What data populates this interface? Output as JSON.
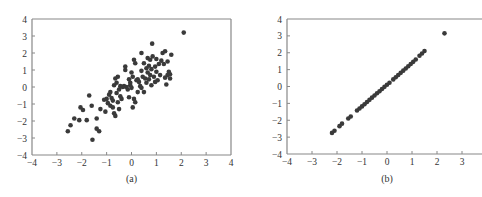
{
  "chart_data": [
    {
      "type": "scatter",
      "title": "",
      "caption": "(a)",
      "xlabel": "",
      "ylabel": "",
      "xlim": [
        -4,
        4
      ],
      "ylim": [
        -4,
        4
      ],
      "xticks": [
        -4,
        -3,
        -2,
        -1,
        0,
        1,
        2,
        3,
        4
      ],
      "yticks": [
        -4,
        -3,
        -2,
        -1,
        0,
        1,
        2,
        3,
        4
      ],
      "grid": false,
      "marker_color": "#3a3a3a",
      "points": [
        [
          2.1,
          3.2
        ],
        [
          0.83,
          2.55
        ],
        [
          -2.56,
          -2.6
        ],
        [
          -1.57,
          -3.1
        ],
        [
          -1.7,
          -0.5
        ],
        [
          -2.45,
          -2.25
        ],
        [
          -2.3,
          -1.85
        ],
        [
          -2.1,
          -1.95
        ],
        [
          -2.05,
          -1.2
        ],
        [
          -1.95,
          -1.35
        ],
        [
          -1.8,
          -1.95
        ],
        [
          -1.6,
          -1.1
        ],
        [
          -1.4,
          -1.85
        ],
        [
          -1.4,
          -2.45
        ],
        [
          -1.3,
          -2.6
        ],
        [
          -1.25,
          -1.3
        ],
        [
          -1.05,
          -1.45
        ],
        [
          -1.0,
          -0.7
        ],
        [
          -0.95,
          -0.95
        ],
        [
          -0.9,
          -0.45
        ],
        [
          -0.85,
          -1.1
        ],
        [
          -0.8,
          -0.65
        ],
        [
          -0.75,
          -0.8
        ],
        [
          -0.75,
          -1.2
        ],
        [
          -0.7,
          0.1
        ],
        [
          -0.7,
          -1.55
        ],
        [
          -0.65,
          0.5
        ],
        [
          -0.65,
          -1.7
        ],
        [
          -0.6,
          -0.35
        ],
        [
          -0.6,
          0.25
        ],
        [
          -0.55,
          -0.9
        ],
        [
          -0.55,
          0.6
        ],
        [
          -0.5,
          -0.15
        ],
        [
          -0.5,
          -1.3
        ],
        [
          -0.45,
          -0.55
        ],
        [
          -0.4,
          -0.7
        ],
        [
          -0.35,
          0.0
        ],
        [
          -0.3,
          0.05
        ],
        [
          -0.25,
          1.0
        ],
        [
          -0.25,
          1.2
        ],
        [
          -0.2,
          0.0
        ],
        [
          -0.15,
          -0.15
        ],
        [
          -0.1,
          0.45
        ],
        [
          -0.1,
          -0.6
        ],
        [
          -0.05,
          0.1
        ],
        [
          0.0,
          0.85
        ],
        [
          0.0,
          -0.05
        ],
        [
          0.05,
          0.6
        ],
        [
          0.05,
          -1.2
        ],
        [
          0.1,
          -0.7
        ],
        [
          0.1,
          1.6
        ],
        [
          0.15,
          1.4
        ],
        [
          0.15,
          -0.9
        ],
        [
          0.2,
          0.4
        ],
        [
          0.25,
          -0.3
        ],
        [
          0.3,
          0.3
        ],
        [
          0.35,
          0.05
        ],
        [
          0.4,
          2.0
        ],
        [
          0.4,
          0.95
        ],
        [
          0.45,
          0.6
        ],
        [
          0.5,
          -0.3
        ],
        [
          0.5,
          1.4
        ],
        [
          0.55,
          0.5
        ],
        [
          0.6,
          1.1
        ],
        [
          0.6,
          0.25
        ],
        [
          0.65,
          0.85
        ],
        [
          0.65,
          1.7
        ],
        [
          0.7,
          0.45
        ],
        [
          0.7,
          1.25
        ],
        [
          0.75,
          1.6
        ],
        [
          0.75,
          0.7
        ],
        [
          0.8,
          1.05
        ],
        [
          0.8,
          0.1
        ],
        [
          0.85,
          1.8
        ],
        [
          0.9,
          0.6
        ],
        [
          0.95,
          1.2
        ],
        [
          0.95,
          0.3
        ],
        [
          1.0,
          0.9
        ],
        [
          1.0,
          1.65
        ],
        [
          1.05,
          0.4
        ],
        [
          1.1,
          1.35
        ],
        [
          1.15,
          0.7
        ],
        [
          1.2,
          1.55
        ],
        [
          1.25,
          2.0
        ],
        [
          1.3,
          1.35
        ],
        [
          1.35,
          0.55
        ],
        [
          1.35,
          2.1
        ],
        [
          1.4,
          0.15
        ],
        [
          1.45,
          1.5
        ],
        [
          1.45,
          0.7
        ],
        [
          1.5,
          0.9
        ],
        [
          1.55,
          0.5
        ],
        [
          1.55,
          0.75
        ],
        [
          1.6,
          1.9
        ],
        [
          -0.85,
          -0.3
        ],
        [
          -1.1,
          -0.75
        ],
        [
          0.25,
          0.45
        ],
        [
          0.4,
          -0.05
        ],
        [
          -0.05,
          0.25
        ],
        [
          -0.45,
          0.05
        ]
      ]
    },
    {
      "type": "scatter",
      "title": "",
      "caption": "(b)",
      "xlabel": "",
      "ylabel": "",
      "xlim": [
        -4,
        4
      ],
      "ylim": [
        -4,
        4
      ],
      "xticks": [
        -4,
        -3,
        -2,
        -1,
        0,
        1,
        2,
        3
      ],
      "yticks": [
        -4,
        -3,
        -2,
        -1,
        0,
        1,
        2,
        3,
        4
      ],
      "grid": false,
      "marker_color": "#3a3a3a",
      "points_description": "points lie on a straight line y ≈ 1.3x from about (-2.25,-2.8) to (1.5,2.15), plus one outlier",
      "line_segment": {
        "x_start": -2.25,
        "y_start": -2.8,
        "x_end": 1.55,
        "y_end": 2.15
      },
      "outlier": [
        2.3,
        3.15
      ],
      "points": [
        [
          -2.2,
          -2.75
        ],
        [
          -2.1,
          -2.62
        ],
        [
          -1.9,
          -2.35
        ],
        [
          -1.8,
          -2.2
        ],
        [
          -1.55,
          -1.9
        ],
        [
          -1.45,
          -1.78
        ],
        [
          -1.2,
          -1.42
        ],
        [
          -1.1,
          -1.3
        ],
        [
          -1.0,
          -1.18
        ],
        [
          -0.9,
          -1.05
        ],
        [
          -0.8,
          -0.92
        ],
        [
          -0.7,
          -0.79
        ],
        [
          -0.6,
          -0.66
        ],
        [
          -0.5,
          -0.53
        ],
        [
          -0.4,
          -0.4
        ],
        [
          -0.3,
          -0.28
        ],
        [
          -0.2,
          -0.15
        ],
        [
          -0.1,
          -0.02
        ],
        [
          0.0,
          0.1
        ],
        [
          0.1,
          0.22
        ],
        [
          0.25,
          0.42
        ],
        [
          0.35,
          0.55
        ],
        [
          0.45,
          0.68
        ],
        [
          0.55,
          0.81
        ],
        [
          0.65,
          0.94
        ],
        [
          0.75,
          1.07
        ],
        [
          0.85,
          1.2
        ],
        [
          0.95,
          1.33
        ],
        [
          1.05,
          1.46
        ],
        [
          1.15,
          1.6
        ],
        [
          1.3,
          1.82
        ],
        [
          1.4,
          1.96
        ],
        [
          1.5,
          2.1
        ],
        [
          2.3,
          3.15
        ]
      ]
    }
  ]
}
